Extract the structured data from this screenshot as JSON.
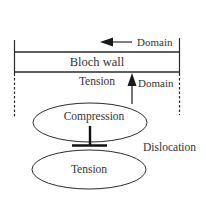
{
  "diagram": {
    "type": "schematic",
    "background": "#ffffff",
    "stroke_color": "#2a2a2a",
    "labels": {
      "domain_top": "Domain",
      "bloch_wall": "Bloch wall",
      "tension_upper": "Tension",
      "domain_right": "Domain",
      "compression": "Compression",
      "dislocation": "Dislocation",
      "tension_lower": "Tension"
    },
    "elements": [
      {
        "id": "bloch-wall-band",
        "shape": "band",
        "label": "Bloch wall"
      },
      {
        "id": "domain-arrow-left",
        "shape": "arrow",
        "direction": "left",
        "label": "Domain"
      },
      {
        "id": "domain-arrow-up",
        "shape": "arrow",
        "direction": "up",
        "label": "Domain"
      },
      {
        "id": "compression-ellipse",
        "shape": "ellipse",
        "label": "Compression"
      },
      {
        "id": "tension-ellipse",
        "shape": "ellipse",
        "label": "Tension"
      },
      {
        "id": "dislocation-symbol",
        "shape": "inverted-T",
        "label": "Dislocation"
      }
    ]
  }
}
